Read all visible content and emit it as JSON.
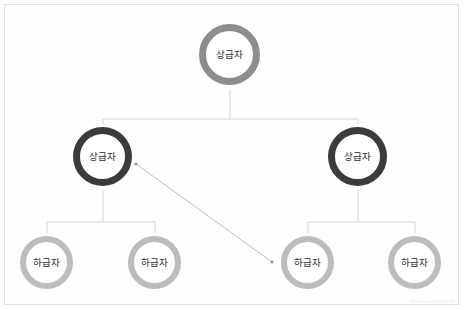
{
  "diagram": {
    "background_color": "#ffffff",
    "border_color": "#e2e2e2",
    "connector_color": "#d0d0d0",
    "arrow_color": "#b0b0b0",
    "levels": [
      {
        "level": 1,
        "ring_color": "#8d8d8d",
        "nodes": [
          {
            "id": "top",
            "label": "상급자",
            "cx": 230,
            "cy": 55
          }
        ]
      },
      {
        "level": 2,
        "ring_color": "#3b3b3b",
        "nodes": [
          {
            "id": "mid-left",
            "label": "상급자",
            "cx": 103,
            "cy": 157
          },
          {
            "id": "mid-right",
            "label": "상급자",
            "cx": 358,
            "cy": 157
          }
        ]
      },
      {
        "level": 3,
        "ring_color": "#bcbcbc",
        "nodes": [
          {
            "id": "leaf-1",
            "label": "하급자",
            "cx": 47,
            "cy": 263
          },
          {
            "id": "leaf-2",
            "label": "하급자",
            "cx": 155,
            "cy": 263
          },
          {
            "id": "leaf-3",
            "label": "하급자",
            "cx": 308,
            "cy": 263
          },
          {
            "id": "leaf-4",
            "label": "하급자",
            "cx": 415,
            "cy": 263
          }
        ]
      }
    ],
    "relation_arrow": {
      "from": "mid-left",
      "to": "leaf-3",
      "x1": 136,
      "y1": 164,
      "x2": 272,
      "y2": 262,
      "double_ended": true
    },
    "watermark": "www.example.kr"
  }
}
